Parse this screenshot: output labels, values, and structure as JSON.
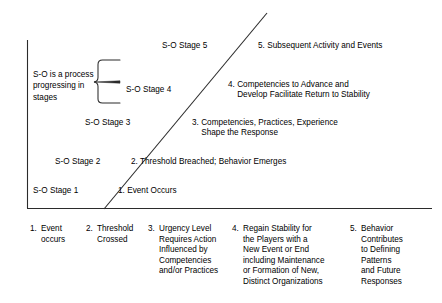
{
  "diagram": {
    "line_color": "#1a1a1a",
    "text_color": "#000000",
    "background": "#ffffff",
    "brace_note": "S-O is a process\nprogressing in\nstages",
    "stages": [
      {
        "stage_label": "S-O Stage 1",
        "description": "1. Event Occurs"
      },
      {
        "stage_label": "S-O Stage 2",
        "description": "2. Threshold Breached; Behavior Emerges"
      },
      {
        "stage_label": "S-O Stage 3",
        "description": "3. Competencies, Practices, Experience\n    Shape the Response"
      },
      {
        "stage_label": "S-O Stage 4",
        "description": "4. Competencies to Advance and\n    Develop Facilitate Return to Stability"
      },
      {
        "stage_label": "S-O Stage 5",
        "description": "5. Subsequent Activity and Events"
      }
    ],
    "footer_items": [
      {
        "number": "1.",
        "text": "Event\noccurs"
      },
      {
        "number": "2.",
        "text": "Threshold\nCrossed"
      },
      {
        "number": "3.",
        "text": "Urgency Level\nRequires Action\nInfluenced by\nCompetencies\nand/or Practices"
      },
      {
        "number": "4.",
        "text": "Regain Stability for\nthe Players with a\nNew Event or End\nincluding Maintenance\nor Formation of New,\nDistinct Organizations"
      },
      {
        "number": "5.",
        "text": "Behavior\nContributes\nto Defining\nPatterns\nand Future\nResponses"
      }
    ]
  }
}
